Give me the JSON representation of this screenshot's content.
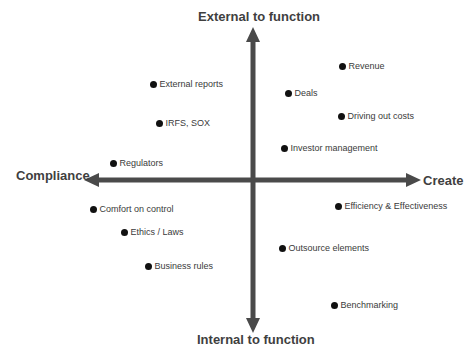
{
  "diagram": {
    "type": "quadrant",
    "axes": {
      "top": "External to function",
      "bottom": "Internal to function",
      "left": "Compliance",
      "right": "Create"
    },
    "colors": {
      "axis": "#4a4a4a",
      "dot": "#111111",
      "label": "#3a3a3a"
    },
    "points": [
      {
        "label": "External reports",
        "x": 153,
        "y": 84
      },
      {
        "label": "Revenue",
        "x": 342,
        "y": 66
      },
      {
        "label": "Deals",
        "x": 288,
        "y": 93
      },
      {
        "label": "IRFS, SOX",
        "x": 159,
        "y": 123
      },
      {
        "label": "Driving out costs",
        "x": 341,
        "y": 116
      },
      {
        "label": "Investor management",
        "x": 284,
        "y": 148
      },
      {
        "label": "Regulators",
        "x": 113,
        "y": 163
      },
      {
        "label": "Comfort on control",
        "x": 93,
        "y": 209
      },
      {
        "label": "Efficiency & Effectiveness",
        "x": 338,
        "y": 206
      },
      {
        "label": "Ethics / Laws",
        "x": 124,
        "y": 232
      },
      {
        "label": "Outsource elements",
        "x": 282,
        "y": 248
      },
      {
        "label": "Business rules",
        "x": 148,
        "y": 266
      },
      {
        "label": "Benchmarking",
        "x": 334,
        "y": 305
      }
    ]
  }
}
